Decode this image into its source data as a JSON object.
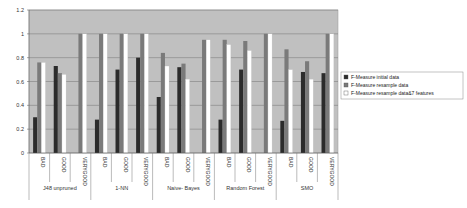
{
  "chart_data": {
    "type": "bar",
    "title": "",
    "xlabel": "",
    "ylabel": "",
    "ylim": [
      0,
      1.2
    ],
    "yticks": [
      "0",
      "0.2",
      "0.4",
      "0.6",
      "0.8",
      "1",
      "1.2"
    ],
    "grid": true,
    "legend_position": "right",
    "groups": [
      {
        "name": "J48 unpruned",
        "categories": [
          "BAD",
          "GOOD",
          "VERYGOOD"
        ]
      },
      {
        "name": "1-NN",
        "categories": [
          "BAD",
          "GOOD",
          "VERYGOOD"
        ]
      },
      {
        "name": "Naive- Bayes",
        "categories": [
          "BAD",
          "GOOD",
          "VERYGOOD"
        ]
      },
      {
        "name": "Random Forest",
        "categories": [
          "BAD",
          "GOOD",
          "VERYGOOD"
        ]
      },
      {
        "name": "SMO",
        "categories": [
          "BAD",
          "GOOD",
          "VERYGOOD"
        ]
      }
    ],
    "categories": [
      "BAD",
      "GOOD",
      "VERYGOOD",
      "BAD",
      "GOOD",
      "VERYGOOD",
      "BAD",
      "GOOD",
      "VERYGOOD",
      "BAD",
      "GOOD",
      "VERYGOOD",
      "BAD",
      "GOOD",
      "VERYGOOD"
    ],
    "series": [
      {
        "name": "F-Measure initial data",
        "color": "#2b2b2b",
        "values": [
          0.3,
          0.73,
          0.0,
          0.28,
          0.7,
          0.8,
          0.47,
          0.72,
          0.0,
          0.28,
          0.7,
          0.0,
          0.27,
          0.68,
          0.67
        ]
      },
      {
        "name": "F-Measure resample data",
        "color": "#7a7a7a",
        "values": [
          0.76,
          0.67,
          1.0,
          1.0,
          1.0,
          1.0,
          0.84,
          0.75,
          0.95,
          0.95,
          0.94,
          1.0,
          0.87,
          0.77,
          1.0
        ]
      },
      {
        "name": "F-Measure resample data&7 features",
        "color": "#ffffff",
        "values": [
          0.76,
          0.66,
          1.0,
          1.0,
          1.0,
          1.0,
          0.73,
          0.62,
          0.95,
          0.91,
          0.86,
          1.0,
          0.7,
          0.62,
          1.0
        ]
      }
    ],
    "plot_background": "#c0c0c0"
  }
}
